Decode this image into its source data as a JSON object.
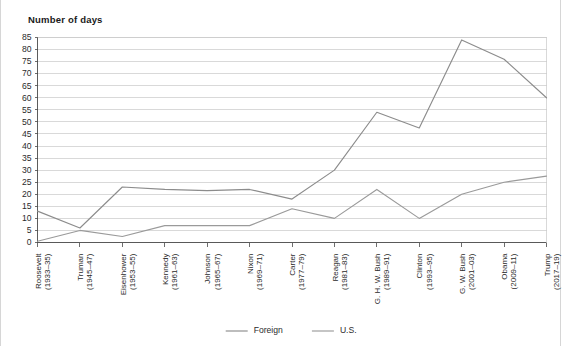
{
  "chart_data": {
    "type": "line",
    "title": "Number of days",
    "xlabel": "",
    "ylabel": "",
    "ylim": [
      0,
      85
    ],
    "ytick_step": 5,
    "yticks": [
      0,
      5,
      10,
      15,
      20,
      25,
      30,
      35,
      40,
      45,
      50,
      55,
      60,
      65,
      70,
      75,
      80,
      85
    ],
    "grid": true,
    "legend_position": "bottom",
    "categories": [
      "Roosevelt\n(1933–35)",
      "Truman\n(1945–47)",
      "Eisenhower\n(1953–55)",
      "Kennedy\n(1961–63)",
      "Johnson\n(1965–67)",
      "Nixon\n(1969–71)",
      "Carter\n(1977–79)",
      "Reagan\n(1981–83)",
      "G. H. W. Bush\n(1989–91)",
      "Clinton\n(1993–95)",
      "G. W. Bush\n(2001–03)",
      "Obama\n(2009–11)",
      "Trump\n(2017–19)"
    ],
    "category_names": [
      "Roosevelt",
      "Truman",
      "Eisenhower",
      "Kennedy",
      "Johnson",
      "Nixon",
      "Carter",
      "Reagan",
      "G. H. W. Bush",
      "Clinton",
      "G. W. Bush",
      "Obama",
      "Trump"
    ],
    "category_years": [
      "(1933–35)",
      "(1945–47)",
      "(1953–55)",
      "(1961–63)",
      "(1965–67)",
      "(1969–71)",
      "(1977–79)",
      "(1981–83)",
      "(1989–91)",
      "(1993–95)",
      "(2001–03)",
      "(2009–11)",
      "(2017–19)"
    ],
    "series": [
      {
        "name": "Foreign",
        "color": "#8c8c8c",
        "values": [
          13,
          6,
          23,
          22,
          21.5,
          22,
          18,
          30,
          54,
          47.5,
          84,
          76,
          60
        ]
      },
      {
        "name": "U.S.",
        "color": "#9a9a9a",
        "values": [
          0.5,
          5,
          2.5,
          7,
          7,
          7,
          14,
          10,
          22,
          10,
          20,
          25,
          27.5
        ]
      }
    ]
  },
  "legend": {
    "items": [
      {
        "label": "Foreign"
      },
      {
        "label": "U.S."
      }
    ]
  },
  "colors": {
    "grid": "#c9c9c9",
    "axis": "#4a4a4a",
    "text": "#2b2b2b",
    "series_foreign": "#8c8c8c",
    "series_us": "#9a9a9a"
  }
}
